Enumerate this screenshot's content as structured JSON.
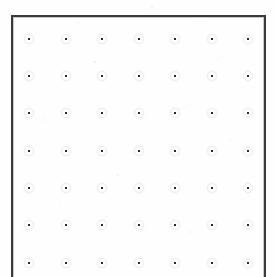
{
  "document": {
    "title": "Dot grid sheet",
    "kind": "scanned-dot-grid-paper",
    "width_px": 275,
    "height_px": 277,
    "background_color": "#fefefe",
    "note_text": ""
  },
  "frame": {
    "name": "grid-border-box",
    "left_px": 11,
    "top_px": 15,
    "right_px": 266,
    "bottom_px": 277,
    "line_color": "#3a3a3c",
    "shadow_color": "#c8c8cc",
    "line_width_px": 1.5,
    "bottom_edge_visible": false,
    "top_edge_visible": true,
    "left_edge_visible": true,
    "right_edge_visible": true
  },
  "grid": {
    "name": "dot-grid",
    "columns": 7,
    "rows": 7,
    "dot_color": "#2b2b2d",
    "dot_size_px": 2.5,
    "dot_shape": "square",
    "column_x_px": [
      29,
      66,
      102,
      139,
      175,
      212,
      248
    ],
    "row_y_px": [
      39,
      76,
      113,
      151,
      188,
      225,
      263
    ],
    "column_spacing_px": 36.5,
    "row_spacing_px": 37.3
  },
  "chart_data": {
    "type": "scatter",
    "title": "",
    "xlabel": "",
    "ylabel": "",
    "xlim": [
      0,
      6
    ],
    "ylim": [
      0,
      6
    ],
    "grid": false,
    "legend": "none",
    "series": [
      {
        "name": "grid-points",
        "x": [
          0,
          1,
          2,
          3,
          4,
          5,
          6,
          0,
          1,
          2,
          3,
          4,
          5,
          6,
          0,
          1,
          2,
          3,
          4,
          5,
          6,
          0,
          1,
          2,
          3,
          4,
          5,
          6,
          0,
          1,
          2,
          3,
          4,
          5,
          6,
          0,
          1,
          2,
          3,
          4,
          5,
          6,
          0,
          1,
          2,
          3,
          4,
          5,
          6
        ],
        "y": [
          6,
          6,
          6,
          6,
          6,
          6,
          6,
          5,
          5,
          5,
          5,
          5,
          5,
          5,
          4,
          4,
          4,
          4,
          4,
          4,
          4,
          3,
          3,
          3,
          3,
          3,
          3,
          3,
          2,
          2,
          2,
          2,
          2,
          2,
          2,
          1,
          1,
          1,
          1,
          1,
          1,
          1,
          0,
          0,
          0,
          0,
          0,
          0,
          0
        ]
      }
    ]
  }
}
